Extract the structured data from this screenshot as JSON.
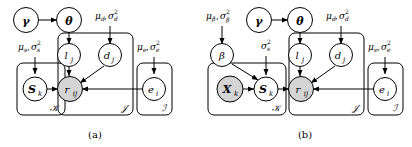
{
  "figure": {
    "type": "plate-notation-graphical-model",
    "background": "#ffffff",
    "stroke": "#000000",
    "shaded_fill": "#d4d4d4",
    "unshaded_fill": "#ffffff",
    "width": 412,
    "height": 147
  },
  "panels": [
    {
      "id": "a",
      "caption": "(a)",
      "hyperparameters": [
        {
          "id": "mu-sigma-d",
          "text": "μₔ, σₔ²",
          "base": "μ",
          "sub": "d"
        },
        {
          "id": "mu-sigma-s",
          "text": "μₛ, σₛ²",
          "base": "μ",
          "sub": "s"
        },
        {
          "id": "mu-sigma-e",
          "text": "μₑ, σₑ²",
          "base": "μ",
          "sub": "e"
        }
      ],
      "nodes": [
        {
          "id": "gamma",
          "label": "γ",
          "shaded": false,
          "bold": true
        },
        {
          "id": "theta",
          "label": "θ",
          "shaded": false,
          "bold": true
        },
        {
          "id": "l_j",
          "label": "l",
          "sub": "j",
          "shaded": false,
          "bold": false
        },
        {
          "id": "d_j",
          "label": "d",
          "sub": "j",
          "shaded": false,
          "bold": false
        },
        {
          "id": "S_k",
          "label": "S",
          "sub": "k",
          "shaded": false,
          "bold": true
        },
        {
          "id": "r_ij",
          "label": "r",
          "sub": "ij",
          "shaded": true,
          "bold": false
        },
        {
          "id": "e_i",
          "label": "e",
          "sub": "i",
          "shaded": false,
          "bold": false
        }
      ],
      "plates": [
        {
          "id": "plate-K",
          "label": "𝒦"
        },
        {
          "id": "plate-J",
          "label": "𝒥"
        },
        {
          "id": "plate-I",
          "label": "𝒥̷"
        }
      ],
      "plate_labels": {
        "K": "𝒦",
        "J": "𝒥",
        "I": "ℐ"
      }
    },
    {
      "id": "b",
      "caption": "(b)",
      "hyperparameters": [
        {
          "id": "mu-sigma-beta",
          "text": "μ_β, σ_β²"
        },
        {
          "id": "sigma-s",
          "text": "σₛ²"
        },
        {
          "id": "mu-sigma-d",
          "text": "μₔ, σₔ²"
        },
        {
          "id": "mu-sigma-e",
          "text": "μₑ, σₑ²"
        }
      ],
      "nodes": [
        {
          "id": "gamma",
          "label": "γ",
          "shaded": false,
          "bold": true
        },
        {
          "id": "theta",
          "label": "θ",
          "shaded": false,
          "bold": true
        },
        {
          "id": "beta",
          "label": "β",
          "shaded": false,
          "bold": false
        },
        {
          "id": "l_j",
          "label": "l",
          "sub": "j",
          "shaded": false,
          "bold": false
        },
        {
          "id": "d_j",
          "label": "d",
          "sub": "j",
          "shaded": false,
          "bold": false
        },
        {
          "id": "X_k",
          "label": "X",
          "sub": "k",
          "shaded": true,
          "bold": true
        },
        {
          "id": "S_k",
          "label": "S",
          "sub": "k",
          "shaded": false,
          "bold": true
        },
        {
          "id": "r_ij",
          "label": "r",
          "sub": "ij",
          "shaded": true,
          "bold": false
        },
        {
          "id": "e_i",
          "label": "e",
          "sub": "i",
          "shaded": false,
          "bold": false
        }
      ],
      "plate_labels": {
        "K": "𝒦",
        "J": "𝒥",
        "I": "ℐ"
      }
    }
  ],
  "glyphs": {
    "gamma": "γ",
    "theta": "θ",
    "beta": "β",
    "mu": "μ",
    "sigma": "σ",
    "sup2": "2",
    "comma": ",",
    "K_script": "𝒦",
    "J_script": "𝒥",
    "I_script": "ℐ"
  }
}
